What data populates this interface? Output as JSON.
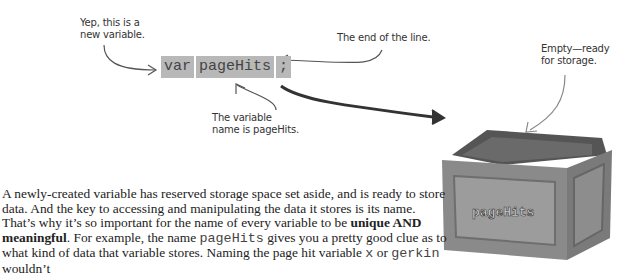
{
  "annotations": {
    "new_variable": [
      "Yep, this is a",
      "new variable."
    ],
    "end_of_line": "The end of the line.",
    "variable_name": [
      "The variable",
      "name is pageHits."
    ],
    "empty_ready": [
      "Empty—ready",
      "for storage."
    ]
  },
  "code": {
    "keyword": "var",
    "identifier": "pageHits",
    "terminator": ";"
  },
  "crate": {
    "label": "pageHits"
  },
  "paragraph": {
    "part1": "A newly-created variable has reserved storage space set aside, and is ready to store data. And the key to accessing  and manipulating the data it stores is its name. That’s why it’s so important for the name of every variable to be ",
    "bold": "unique AND meaningful",
    "part2": ". For example, the name ",
    "code1": "pageHits",
    "part3": " gives you a pretty good clue as to what kind of data that variable stores. Naming the page hit variable ",
    "code2": "x",
    "part4": " or ",
    "code3": "gerkin",
    "part5": " wouldn’t"
  }
}
